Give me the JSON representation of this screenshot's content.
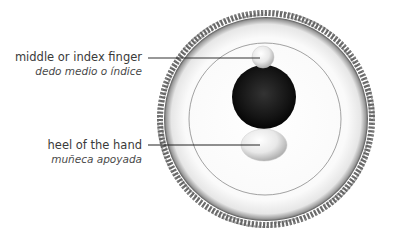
{
  "diagram": {
    "labels": [
      {
        "id": "finger",
        "english": "middle or index finger",
        "spanish": "dedo medio o índice"
      },
      {
        "id": "heel",
        "english": "heel of the hand",
        "spanish": "muñeca apoyada"
      }
    ],
    "colors": {
      "background": "#ffffff",
      "leader_line": "#333333",
      "ball_dark": "#111111",
      "ring_beads": "#555555",
      "inner_circle": "#888888"
    }
  }
}
